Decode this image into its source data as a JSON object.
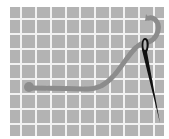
{
  "illustration": {
    "subject": "needle-and-thread-on-grid",
    "colors": {
      "background": "#ffffff",
      "grid_cell": "#b3b3b3",
      "grid_line": "#f2f2f2",
      "thread": "#8c8c8c",
      "needle": "#111111"
    },
    "grid": {
      "columns": 10,
      "rows": 9
    }
  }
}
